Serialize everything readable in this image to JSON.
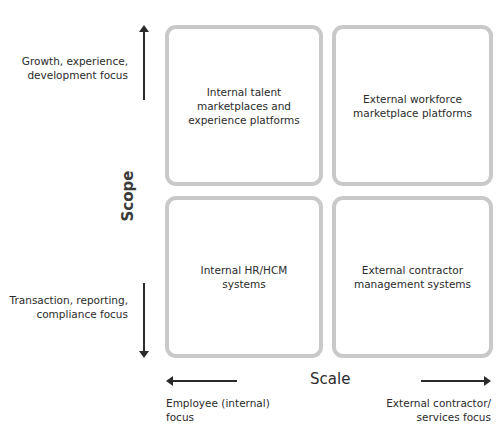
{
  "quadrants": {
    "top_left": "Internal talent\nmarketplaces and\nexperience platforms",
    "top_right": "External workforce\nmarketplace platforms",
    "bottom_left": "Internal HR/HCM\nsystems",
    "bottom_right": "External contractor\nmanagement systems"
  },
  "y_axis": {
    "title": "Scope",
    "top_label": "Growth, experience,\ndevelopment focus",
    "bottom_label": "Transaction, reporting,\ncompliance focus"
  },
  "x_axis": {
    "title": "Scale",
    "left_label": "Employee (internal)\nfocus",
    "right_label": "External contractor/\nservices focus"
  },
  "colors": {
    "box_border": "#c9c9c9",
    "text": "#2b2b2b",
    "arrow": "#2b2b2b"
  }
}
